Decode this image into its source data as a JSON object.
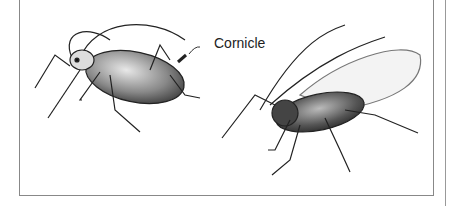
{
  "figure": {
    "label": "Cornicle",
    "subjects": [
      "wingless aphid",
      "winged aphid"
    ]
  }
}
